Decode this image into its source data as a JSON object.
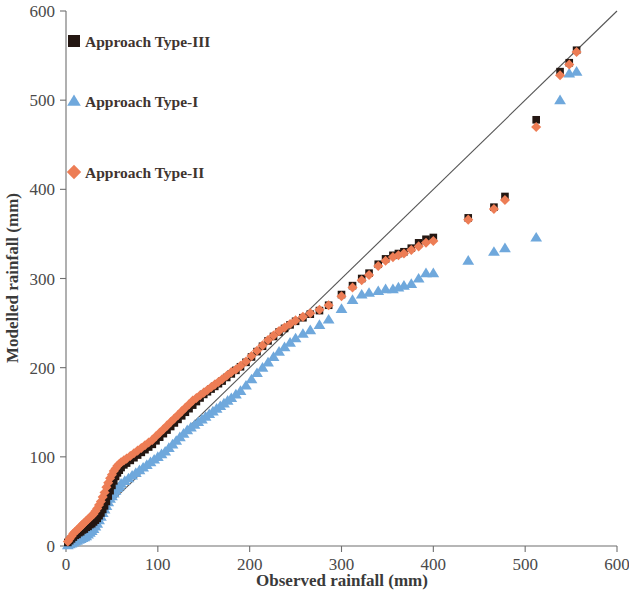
{
  "chart_data": {
    "type": "scatter",
    "title": "",
    "xlabel": "Observed rainfall (mm)",
    "ylabel": "Modelled rainfall (mm)",
    "xlim": [
      0,
      600
    ],
    "ylim": [
      0,
      600
    ],
    "xticks": [
      0,
      100,
      200,
      300,
      400,
      500,
      600
    ],
    "yticks": [
      0,
      100,
      200,
      300,
      400,
      500,
      600
    ],
    "grid": false,
    "legend_position": "upper-left inside",
    "reference_line": {
      "name": "1:1 line",
      "from": [
        0,
        0
      ],
      "to": [
        600,
        600
      ],
      "color": "#555555"
    },
    "series": [
      {
        "name": "Approach Type-III",
        "marker": "square",
        "color": "#241712",
        "points": [
          [
            2,
            4
          ],
          [
            4,
            6
          ],
          [
            6,
            8
          ],
          [
            8,
            10
          ],
          [
            10,
            12
          ],
          [
            12,
            13
          ],
          [
            14,
            15
          ],
          [
            16,
            16
          ],
          [
            18,
            18
          ],
          [
            20,
            19
          ],
          [
            22,
            21
          ],
          [
            24,
            22
          ],
          [
            26,
            24
          ],
          [
            28,
            25
          ],
          [
            30,
            27
          ],
          [
            32,
            29
          ],
          [
            34,
            31
          ],
          [
            36,
            34
          ],
          [
            38,
            37
          ],
          [
            40,
            41
          ],
          [
            42,
            45
          ],
          [
            44,
            50
          ],
          [
            46,
            56
          ],
          [
            48,
            62
          ],
          [
            50,
            68
          ],
          [
            52,
            73
          ],
          [
            54,
            78
          ],
          [
            56,
            82
          ],
          [
            58,
            85
          ],
          [
            60,
            88
          ],
          [
            63,
            91
          ],
          [
            66,
            93
          ],
          [
            70,
            96
          ],
          [
            74,
            99
          ],
          [
            78,
            102
          ],
          [
            82,
            105
          ],
          [
            86,
            108
          ],
          [
            90,
            111
          ],
          [
            94,
            114
          ],
          [
            98,
            118
          ],
          [
            102,
            122
          ],
          [
            106,
            126
          ],
          [
            110,
            130
          ],
          [
            114,
            134
          ],
          [
            118,
            138
          ],
          [
            122,
            142
          ],
          [
            126,
            146
          ],
          [
            130,
            150
          ],
          [
            134,
            154
          ],
          [
            138,
            158
          ],
          [
            142,
            162
          ],
          [
            146,
            166
          ],
          [
            150,
            170
          ],
          [
            154,
            173
          ],
          [
            158,
            176
          ],
          [
            162,
            179
          ],
          [
            166,
            182
          ],
          [
            170,
            185
          ],
          [
            175,
            189
          ],
          [
            180,
            193
          ],
          [
            185,
            197
          ],
          [
            190,
            201
          ],
          [
            196,
            206
          ],
          [
            202,
            212
          ],
          [
            208,
            218
          ],
          [
            214,
            224
          ],
          [
            220,
            230
          ],
          [
            226,
            235
          ],
          [
            232,
            240
          ],
          [
            238,
            244
          ],
          [
            244,
            248
          ],
          [
            250,
            252
          ],
          [
            258,
            256
          ],
          [
            266,
            260
          ],
          [
            276,
            264
          ],
          [
            286,
            270
          ],
          [
            300,
            282
          ],
          [
            312,
            292
          ],
          [
            322,
            300
          ],
          [
            330,
            306
          ],
          [
            340,
            316
          ],
          [
            348,
            322
          ],
          [
            356,
            326
          ],
          [
            362,
            328
          ],
          [
            368,
            330
          ],
          [
            376,
            334
          ],
          [
            384,
            340
          ],
          [
            392,
            344
          ],
          [
            400,
            346
          ],
          [
            438,
            368
          ],
          [
            466,
            380
          ],
          [
            478,
            392
          ],
          [
            512,
            478
          ],
          [
            538,
            532
          ],
          [
            548,
            542
          ],
          [
            556,
            556
          ]
        ]
      },
      {
        "name": "Approach Type-I",
        "marker": "triangle",
        "color": "#6FA8DC",
        "points": [
          [
            2,
            1
          ],
          [
            4,
            2
          ],
          [
            6,
            3
          ],
          [
            8,
            4
          ],
          [
            10,
            5
          ],
          [
            12,
            6
          ],
          [
            14,
            7
          ],
          [
            16,
            8
          ],
          [
            18,
            9
          ],
          [
            20,
            10
          ],
          [
            22,
            11
          ],
          [
            24,
            13
          ],
          [
            26,
            15
          ],
          [
            28,
            17
          ],
          [
            30,
            19
          ],
          [
            32,
            22
          ],
          [
            34,
            25
          ],
          [
            36,
            29
          ],
          [
            38,
            33
          ],
          [
            40,
            37
          ],
          [
            42,
            41
          ],
          [
            44,
            45
          ],
          [
            46,
            49
          ],
          [
            48,
            53
          ],
          [
            50,
            56
          ],
          [
            52,
            59
          ],
          [
            54,
            62
          ],
          [
            56,
            65
          ],
          [
            58,
            67
          ],
          [
            60,
            70
          ],
          [
            64,
            73
          ],
          [
            68,
            76
          ],
          [
            72,
            79
          ],
          [
            76,
            82
          ],
          [
            80,
            85
          ],
          [
            84,
            88
          ],
          [
            88,
            91
          ],
          [
            92,
            94
          ],
          [
            96,
            97
          ],
          [
            100,
            100
          ],
          [
            104,
            103
          ],
          [
            108,
            106
          ],
          [
            112,
            110
          ],
          [
            116,
            114
          ],
          [
            120,
            118
          ],
          [
            124,
            122
          ],
          [
            128,
            126
          ],
          [
            132,
            130
          ],
          [
            136,
            133
          ],
          [
            140,
            136
          ],
          [
            144,
            139
          ],
          [
            148,
            142
          ],
          [
            152,
            145
          ],
          [
            156,
            148
          ],
          [
            160,
            151
          ],
          [
            164,
            154
          ],
          [
            168,
            157
          ],
          [
            172,
            160
          ],
          [
            176,
            163
          ],
          [
            180,
            166
          ],
          [
            185,
            170
          ],
          [
            190,
            174
          ],
          [
            196,
            180
          ],
          [
            202,
            187
          ],
          [
            208,
            194
          ],
          [
            214,
            200
          ],
          [
            220,
            206
          ],
          [
            226,
            212
          ],
          [
            232,
            218
          ],
          [
            238,
            223
          ],
          [
            244,
            228
          ],
          [
            250,
            233
          ],
          [
            258,
            238
          ],
          [
            266,
            242
          ],
          [
            276,
            248
          ],
          [
            286,
            254
          ],
          [
            300,
            266
          ],
          [
            312,
            276
          ],
          [
            322,
            282
          ],
          [
            330,
            284
          ],
          [
            340,
            286
          ],
          [
            348,
            288
          ],
          [
            356,
            288
          ],
          [
            362,
            290
          ],
          [
            368,
            292
          ],
          [
            376,
            294
          ],
          [
            384,
            300
          ],
          [
            392,
            306
          ],
          [
            400,
            306
          ],
          [
            438,
            320
          ],
          [
            466,
            330
          ],
          [
            478,
            334
          ],
          [
            512,
            346
          ],
          [
            538,
            500
          ],
          [
            548,
            530
          ],
          [
            556,
            532
          ]
        ]
      },
      {
        "name": "Approach Type-II",
        "marker": "diamond",
        "color": "#ED7D55",
        "points": [
          [
            2,
            5
          ],
          [
            4,
            8
          ],
          [
            6,
            11
          ],
          [
            8,
            14
          ],
          [
            10,
            16
          ],
          [
            12,
            18
          ],
          [
            14,
            20
          ],
          [
            16,
            22
          ],
          [
            18,
            24
          ],
          [
            20,
            26
          ],
          [
            22,
            28
          ],
          [
            24,
            30
          ],
          [
            26,
            32
          ],
          [
            28,
            34
          ],
          [
            30,
            36
          ],
          [
            32,
            39
          ],
          [
            34,
            42
          ],
          [
            36,
            46
          ],
          [
            38,
            50
          ],
          [
            40,
            55
          ],
          [
            42,
            60
          ],
          [
            44,
            66
          ],
          [
            46,
            71
          ],
          [
            48,
            76
          ],
          [
            50,
            80
          ],
          [
            52,
            84
          ],
          [
            54,
            87
          ],
          [
            56,
            90
          ],
          [
            58,
            92
          ],
          [
            60,
            94
          ],
          [
            63,
            96
          ],
          [
            66,
            98
          ],
          [
            70,
            101
          ],
          [
            74,
            104
          ],
          [
            78,
            107
          ],
          [
            82,
            110
          ],
          [
            86,
            113
          ],
          [
            90,
            116
          ],
          [
            94,
            119
          ],
          [
            98,
            123
          ],
          [
            102,
            127
          ],
          [
            106,
            131
          ],
          [
            110,
            135
          ],
          [
            114,
            139
          ],
          [
            118,
            143
          ],
          [
            122,
            147
          ],
          [
            126,
            151
          ],
          [
            130,
            155
          ],
          [
            134,
            159
          ],
          [
            138,
            163
          ],
          [
            142,
            166
          ],
          [
            146,
            169
          ],
          [
            150,
            172
          ],
          [
            154,
            175
          ],
          [
            158,
            178
          ],
          [
            162,
            181
          ],
          [
            166,
            184
          ],
          [
            170,
            187
          ],
          [
            175,
            191
          ],
          [
            180,
            195
          ],
          [
            185,
            198
          ],
          [
            190,
            202
          ],
          [
            196,
            207
          ],
          [
            202,
            213
          ],
          [
            208,
            219
          ],
          [
            214,
            225
          ],
          [
            220,
            231
          ],
          [
            226,
            236
          ],
          [
            232,
            241
          ],
          [
            238,
            245
          ],
          [
            244,
            249
          ],
          [
            250,
            253
          ],
          [
            258,
            257
          ],
          [
            266,
            261
          ],
          [
            276,
            265
          ],
          [
            286,
            270
          ],
          [
            300,
            280
          ],
          [
            312,
            290
          ],
          [
            322,
            298
          ],
          [
            330,
            304
          ],
          [
            340,
            314
          ],
          [
            348,
            320
          ],
          [
            356,
            324
          ],
          [
            362,
            326
          ],
          [
            368,
            328
          ],
          [
            376,
            332
          ],
          [
            384,
            336
          ],
          [
            392,
            340
          ],
          [
            400,
            342
          ],
          [
            438,
            366
          ],
          [
            466,
            378
          ],
          [
            478,
            388
          ],
          [
            512,
            470
          ],
          [
            538,
            528
          ],
          [
            548,
            540
          ],
          [
            556,
            554
          ]
        ]
      }
    ]
  },
  "legend": {
    "items": [
      {
        "label": "Approach Type-III",
        "marker": "square",
        "color": "#241712"
      },
      {
        "label": "Approach Type-I",
        "marker": "triangle",
        "color": "#6FA8DC"
      },
      {
        "label": "Approach Type-II",
        "marker": "diamond",
        "color": "#ED7D55"
      }
    ]
  },
  "axes": {
    "x_title": "Observed rainfall (mm)",
    "y_title": "Modelled rainfall (mm)",
    "x_tick_labels": [
      "0",
      "100",
      "200",
      "300",
      "400",
      "500",
      "600"
    ],
    "y_tick_labels": [
      "0",
      "100",
      "200",
      "300",
      "400",
      "500",
      "600"
    ]
  }
}
